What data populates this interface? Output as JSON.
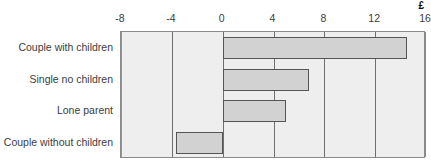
{
  "unit": {
    "symbol": "£"
  },
  "chart_data": {
    "type": "bar",
    "orientation": "horizontal",
    "title": "",
    "subtitle": "",
    "xlabel": "£",
    "ylabel": "",
    "categories": [
      "Couple with children",
      "Single no children",
      "Lone parent",
      "Couple without children"
    ],
    "values": [
      14.5,
      6.8,
      5.0,
      -3.7
    ],
    "series": [
      {
        "name": "Amount",
        "values": [
          14.5,
          6.8,
          5.0,
          -3.7
        ]
      }
    ],
    "xticks": [
      -8,
      -4,
      0,
      4,
      8,
      12,
      16
    ],
    "xtick_labels": [
      "-8",
      "-4",
      "0",
      "4",
      "8",
      "12",
      "16"
    ],
    "xlim": [
      -8,
      16
    ],
    "grid": true,
    "grid_axis": "x",
    "legend": false,
    "legend_position": "none",
    "bar_fill_color": "#d2d2d2",
    "bar_border_color": "#555555",
    "plot_background_color": "#eeeeee",
    "gridline_color": "#6f6f6f",
    "axis_border_color": "#8a8a8a",
    "annotations": []
  }
}
